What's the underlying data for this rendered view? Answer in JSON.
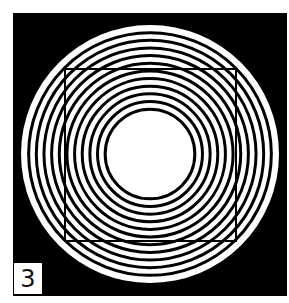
{
  "figure": {
    "panel_label": "3",
    "colors": {
      "background": "#000000",
      "ring_light": "#ffffff",
      "ring_dark": "#000000",
      "square_stroke": "#000000",
      "page": "#ffffff"
    },
    "panel": {
      "x": 13,
      "y": 13,
      "width": 274,
      "height": 283
    },
    "circles": {
      "cx": 150,
      "cy": 154,
      "outer_radius": 129,
      "inner_radius": 41,
      "ring_count": 11,
      "ring_stroke_width": 3
    },
    "square": {
      "x": 65,
      "y": 69,
      "width": 171,
      "height": 172,
      "stroke_width": 2
    }
  }
}
